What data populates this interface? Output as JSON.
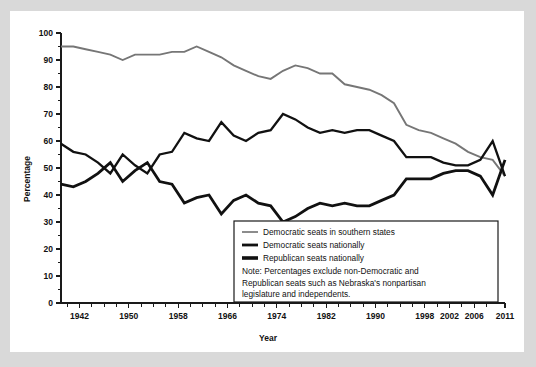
{
  "chart_data": {
    "type": "line",
    "title": "",
    "xlabel": "Year",
    "ylabel": "Percentage",
    "xlim": [
      1939,
      2011
    ],
    "ylim": [
      0,
      100
    ],
    "grid": false,
    "legend_position": "inside-bottom-right",
    "ytick_labels": [
      "0",
      "10",
      "20",
      "30",
      "40",
      "50",
      "60",
      "70",
      "80",
      "90",
      "100"
    ],
    "ytick_values": [
      0,
      10,
      20,
      30,
      40,
      50,
      60,
      70,
      80,
      90,
      100
    ],
    "xtick_values": [
      1942,
      1950,
      1958,
      1966,
      1974,
      1982,
      1990,
      1998,
      2002,
      2006,
      2011
    ],
    "xtick_labels": [
      "1942",
      "1950",
      "1958",
      "1966",
      "1974",
      "1982",
      "1990",
      "1998",
      "2002",
      "2006",
      "2011"
    ],
    "xtick_minor_values": [
      1940,
      1944,
      1946,
      1948,
      1952,
      1954,
      1956,
      1960,
      1962,
      1964,
      1968,
      1970,
      1972,
      1976,
      1978,
      1980,
      1984,
      1986,
      1988,
      1992,
      1994,
      1996,
      2000,
      2004,
      2008
    ],
    "series": [
      {
        "name": "Democratic seats in southern states",
        "color": "#767676",
        "stroke_width": 1.9,
        "x": [
          1939,
          1941,
          1943,
          1945,
          1947,
          1949,
          1951,
          1953,
          1955,
          1957,
          1959,
          1961,
          1963,
          1965,
          1967,
          1969,
          1971,
          1973,
          1975,
          1977,
          1979,
          1981,
          1983,
          1985,
          1987,
          1989,
          1991,
          1993,
          1995,
          1997,
          1999,
          2001,
          2003,
          2005,
          2007,
          2009,
          2011
        ],
        "values": [
          95,
          95,
          94,
          93,
          92,
          90,
          92,
          92,
          92,
          93,
          93,
          95,
          93,
          91,
          88,
          86,
          84,
          83,
          86,
          88,
          87,
          85,
          85,
          81,
          80,
          79,
          77,
          74,
          66,
          64,
          63,
          61,
          59,
          56,
          54,
          53,
          47
        ]
      },
      {
        "name": "Democratic seats nationally",
        "color": "#111111",
        "stroke_width": 2.3,
        "x": [
          1939,
          1941,
          1943,
          1945,
          1947,
          1949,
          1951,
          1953,
          1955,
          1957,
          1959,
          1961,
          1963,
          1965,
          1967,
          1969,
          1971,
          1973,
          1975,
          1977,
          1979,
          1981,
          1983,
          1985,
          1987,
          1989,
          1991,
          1993,
          1995,
          1997,
          1999,
          2001,
          2003,
          2005,
          2007,
          2009,
          2011
        ],
        "values": [
          59,
          56,
          55,
          52,
          48,
          55,
          51,
          48,
          55,
          56,
          63,
          61,
          60,
          67,
          62,
          60,
          63,
          64,
          70,
          68,
          65,
          63,
          64,
          63,
          64,
          64,
          62,
          60,
          54,
          54,
          54,
          52,
          51,
          51,
          53,
          60,
          47
        ]
      },
      {
        "name": "Republican seats nationally",
        "color": "#111111",
        "stroke_width": 2.8,
        "x": [
          1939,
          1941,
          1943,
          1945,
          1947,
          1949,
          1951,
          1953,
          1955,
          1957,
          1959,
          1961,
          1963,
          1965,
          1967,
          1969,
          1971,
          1973,
          1975,
          1977,
          1979,
          1981,
          1983,
          1985,
          1987,
          1989,
          1991,
          1993,
          1995,
          1997,
          1999,
          2001,
          2003,
          2005,
          2007,
          2009,
          2011
        ],
        "values": [
          44,
          43,
          45,
          48,
          52,
          45,
          49,
          52,
          45,
          44,
          37,
          39,
          40,
          33,
          38,
          40,
          37,
          36,
          30,
          32,
          35,
          37,
          36,
          37,
          36,
          36,
          38,
          40,
          46,
          46,
          46,
          48,
          49,
          49,
          47,
          40,
          53
        ]
      }
    ]
  },
  "legend": {
    "entries": [
      {
        "label": "Democratic seats in southern states",
        "swatch_color": "#8c8c8c",
        "swatch_weight": 2.0
      },
      {
        "label": "Democratic seats nationally",
        "swatch_color": "#111111",
        "swatch_weight": 2.8
      },
      {
        "label": "Republican seats nationally",
        "swatch_color": "#111111",
        "swatch_weight": 3.6
      }
    ],
    "note_lines": [
      "Note: Percentages exclude non-Democratic and",
      "Republican seats such as Nebraska's nonpartisan",
      "legislature and independents."
    ]
  }
}
